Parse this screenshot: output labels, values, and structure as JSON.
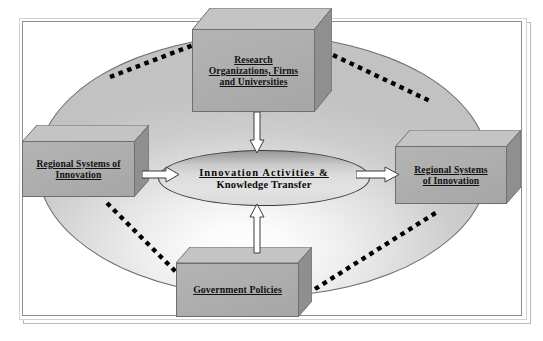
{
  "diagram": {
    "frame": {
      "border_color": "#8e8e8e",
      "shadow_color": "#b9b9b9"
    },
    "background_ellipse": {
      "name": "macro-environment-ellipse",
      "fill_light": "#ffffff",
      "fill_dark": "#c2c2c2",
      "border_color": "#6f6f6f"
    },
    "core": {
      "name": "core-ellipse",
      "line1": "Innovation  Activities  &",
      "line2": "Knowledge Transfer",
      "fill_top": "#989898",
      "fill_bottom": "#e2e2e2",
      "border_color": "#3b3b3b"
    },
    "boxes": [
      {
        "id": "research-organizations",
        "label": "Research\nOrganizations, Firms\nand Universities",
        "position": "top",
        "fill": "#aeaeae",
        "top_face": "#c4c4c4",
        "side_face": "#8f8f8f"
      },
      {
        "id": "regional-systems-left",
        "label": "Regional Systems of\nInnovation",
        "position": "left",
        "fill": "#aeaeae",
        "top_face": "#c4c4c4",
        "side_face": "#8f8f8f"
      },
      {
        "id": "regional-systems-right",
        "label": "Regional Systems\nof  Innovation",
        "position": "right",
        "fill": "#aeaeae",
        "top_face": "#c4c4c4",
        "side_face": "#8f8f8f"
      },
      {
        "id": "government-policies",
        "label": "Government Policies",
        "position": "bottom",
        "fill": "#aeaeae",
        "top_face": "#c4c4c4",
        "side_face": "#8f8f8f"
      }
    ],
    "arrows": [
      {
        "id": "arrow-top-down",
        "direction": "down",
        "from": "research-organizations",
        "to": "core-ellipse"
      },
      {
        "id": "arrow-left-right",
        "direction": "right",
        "from": "regional-systems-left",
        "to": "core-ellipse"
      },
      {
        "id": "arrow-core-right",
        "direction": "right",
        "from": "core-ellipse",
        "to": "regional-systems-right"
      },
      {
        "id": "arrow-bottom-up",
        "direction": "up",
        "from": "government-policies",
        "to": "core-ellipse"
      }
    ],
    "dotted_links": [
      {
        "id": "link-left-to-top",
        "from": "regional-systems-left",
        "to": "research-organizations"
      },
      {
        "id": "link-top-to-right",
        "from": "research-organizations",
        "to": "regional-systems-right"
      },
      {
        "id": "link-left-to-bottom",
        "from": "regional-systems-left",
        "to": "government-policies"
      },
      {
        "id": "link-bottom-to-right",
        "from": "government-policies",
        "to": "regional-systems-right"
      }
    ]
  }
}
